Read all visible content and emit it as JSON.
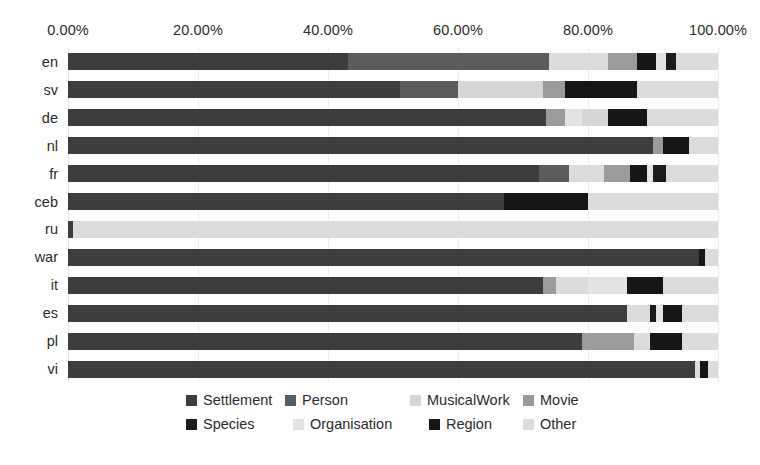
{
  "chart_data": {
    "type": "bar",
    "orientation": "horizontal",
    "stacked": true,
    "normalized": true,
    "title": "",
    "subtitle": "",
    "xlabel": "",
    "ylabel": "",
    "grid": true,
    "legend_position": "bottom",
    "xlim": [
      0,
      100
    ],
    "xtick_values": [
      0,
      20,
      40,
      60,
      80,
      100
    ],
    "xtick_labels": [
      "0.00%",
      "20.00%",
      "40.00%",
      "60.00%",
      "80.00%",
      "100.00%"
    ],
    "categories": [
      "en",
      "sv",
      "de",
      "nl",
      "fr",
      "ceb",
      "ru",
      "war",
      "it",
      "es",
      "pl",
      "vi"
    ],
    "series": [
      {
        "name": "Settlement",
        "color": "#3d3d3d",
        "values": [
          43.0,
          51.0,
          73.5,
          90.0,
          72.5,
          67.0,
          0.8,
          97.0,
          73.0,
          86.0,
          79.0,
          96.5
        ]
      },
      {
        "name": "Person",
        "color": "#5c5c5c",
        "values": [
          0.0,
          9.0,
          0.0,
          0.0,
          0.0,
          0.0,
          0.0,
          0.0,
          0.0,
          0.0,
          0.0,
          0.0
        ]
      },
      {
        "name": "MusicalWork",
        "color": "#d6d6d6",
        "values": [
          0.0,
          13.0,
          0.0,
          0.0,
          0.0,
          0.0,
          0.0,
          0.0,
          0.0,
          0.0,
          0.0,
          0.0
        ]
      },
      {
        "name": "Movie",
        "color": "#9b9b9b",
        "values": [
          31.0,
          0.0,
          0.0,
          0.0,
          0.0,
          0.0,
          0.0,
          0.0,
          0.0,
          0.0,
          8.0,
          0.0
        ]
      },
      {
        "name": "Species",
        "color": "#1c1c1c",
        "values": [
          0.0,
          0.0,
          0.0,
          0.0,
          0.0,
          0.0,
          0.0,
          0.0,
          0.0,
          0.0,
          0.0,
          0.0
        ]
      },
      {
        "name": "Organisation",
        "color": "#e4e4e4",
        "values": [
          8.5,
          0.0,
          6.5,
          0.0,
          5.0,
          0.0,
          0.0,
          0.0,
          6.0,
          0.0,
          0.0,
          0.0
        ]
      },
      {
        "name": "Region",
        "color": "#161616",
        "values": [
          3.0,
          11.0,
          4.0,
          4.0,
          4.5,
          13.0,
          0.0,
          1.0,
          4.0,
          3.0,
          5.0,
          1.5
        ]
      },
      {
        "name": "Other",
        "color": "#dcdcdc",
        "values": [
          14.5,
          16.0,
          16.0,
          6.0,
          18.0,
          20.0,
          99.2,
          2.0,
          17.0,
          11.0,
          8.0,
          2.0
        ]
      }
    ],
    "stacks": [
      {
        "category": "en",
        "segments": [
          {
            "name": "Settlement",
            "color": "#3d3d3d",
            "start": 0.0,
            "value": 43.0
          },
          {
            "name": "Person",
            "color": "#5c5c5c",
            "start": 43.0,
            "value": 31.0
          },
          {
            "name": "Other",
            "color": "#dcdcdc",
            "start": 74.0,
            "value": 9.0
          },
          {
            "name": "Movie",
            "color": "#9b9b9b",
            "start": 83.0,
            "value": 4.5
          },
          {
            "name": "Region",
            "color": "#161616",
            "start": 87.5,
            "value": 3.0
          },
          {
            "name": "Organisation",
            "color": "#e4e4e4",
            "start": 90.5,
            "value": 1.5
          },
          {
            "name": "Species",
            "color": "#1c1c1c",
            "start": 92.0,
            "value": 1.5
          },
          {
            "name": "Other",
            "color": "#dcdcdc",
            "start": 93.5,
            "value": 6.5
          }
        ]
      },
      {
        "category": "sv",
        "segments": [
          {
            "name": "Settlement",
            "color": "#3d3d3d",
            "start": 0.0,
            "value": 51.0
          },
          {
            "name": "Person",
            "color": "#5c5c5c",
            "start": 51.0,
            "value": 9.0
          },
          {
            "name": "MusicalWork",
            "color": "#d6d6d6",
            "start": 60.0,
            "value": 13.0
          },
          {
            "name": "Movie",
            "color": "#9b9b9b",
            "start": 73.0,
            "value": 3.5
          },
          {
            "name": "Region",
            "color": "#161616",
            "start": 76.5,
            "value": 11.0
          },
          {
            "name": "Other",
            "color": "#dcdcdc",
            "start": 87.5,
            "value": 12.5
          }
        ]
      },
      {
        "category": "de",
        "segments": [
          {
            "name": "Settlement",
            "color": "#3d3d3d",
            "start": 0.0,
            "value": 73.5
          },
          {
            "name": "Movie",
            "color": "#9b9b9b",
            "start": 73.5,
            "value": 3.0
          },
          {
            "name": "Organisation",
            "color": "#e4e4e4",
            "start": 76.5,
            "value": 2.5
          },
          {
            "name": "MusicalWork",
            "color": "#d6d6d6",
            "start": 79.0,
            "value": 4.0
          },
          {
            "name": "Region",
            "color": "#161616",
            "start": 83.0,
            "value": 6.0
          },
          {
            "name": "Other",
            "color": "#dcdcdc",
            "start": 89.0,
            "value": 11.0
          }
        ]
      },
      {
        "category": "nl",
        "segments": [
          {
            "name": "Settlement",
            "color": "#3d3d3d",
            "start": 0.0,
            "value": 90.0
          },
          {
            "name": "Movie",
            "color": "#9b9b9b",
            "start": 90.0,
            "value": 1.5
          },
          {
            "name": "Region",
            "color": "#161616",
            "start": 91.5,
            "value": 4.0
          },
          {
            "name": "Other",
            "color": "#dcdcdc",
            "start": 95.5,
            "value": 4.5
          }
        ]
      },
      {
        "category": "fr",
        "segments": [
          {
            "name": "Settlement",
            "color": "#3d3d3d",
            "start": 0.0,
            "value": 72.5
          },
          {
            "name": "Person",
            "color": "#5c5c5c",
            "start": 72.5,
            "value": 4.5
          },
          {
            "name": "Other",
            "color": "#dcdcdc",
            "start": 77.0,
            "value": 5.5
          },
          {
            "name": "Movie",
            "color": "#9b9b9b",
            "start": 82.5,
            "value": 4.0
          },
          {
            "name": "Region",
            "color": "#161616",
            "start": 86.5,
            "value": 2.5
          },
          {
            "name": "Organisation",
            "color": "#e4e4e4",
            "start": 89.0,
            "value": 1.0
          },
          {
            "name": "Species",
            "color": "#1c1c1c",
            "start": 90.0,
            "value": 2.0
          },
          {
            "name": "Other",
            "color": "#dcdcdc",
            "start": 92.0,
            "value": 8.0
          }
        ]
      },
      {
        "category": "ceb",
        "segments": [
          {
            "name": "Settlement",
            "color": "#3d3d3d",
            "start": 0.0,
            "value": 67.0
          },
          {
            "name": "Region",
            "color": "#161616",
            "start": 67.0,
            "value": 13.0
          },
          {
            "name": "Other",
            "color": "#dcdcdc",
            "start": 80.0,
            "value": 20.0
          }
        ]
      },
      {
        "category": "ru",
        "segments": [
          {
            "name": "Settlement",
            "color": "#3d3d3d",
            "start": 0.0,
            "value": 0.8
          },
          {
            "name": "Other",
            "color": "#dcdcdc",
            "start": 0.8,
            "value": 99.2
          }
        ]
      },
      {
        "category": "war",
        "segments": [
          {
            "name": "Settlement",
            "color": "#3d3d3d",
            "start": 0.0,
            "value": 97.0
          },
          {
            "name": "Region",
            "color": "#161616",
            "start": 97.0,
            "value": 1.0
          },
          {
            "name": "Other",
            "color": "#dcdcdc",
            "start": 98.0,
            "value": 2.0
          }
        ]
      },
      {
        "category": "it",
        "segments": [
          {
            "name": "Settlement",
            "color": "#3d3d3d",
            "start": 0.0,
            "value": 73.0
          },
          {
            "name": "Movie",
            "color": "#9b9b9b",
            "start": 73.0,
            "value": 2.0
          },
          {
            "name": "Other",
            "color": "#dcdcdc",
            "start": 75.0,
            "value": 5.0
          },
          {
            "name": "Organisation",
            "color": "#e4e4e4",
            "start": 80.0,
            "value": 6.0
          },
          {
            "name": "Region",
            "color": "#161616",
            "start": 86.0,
            "value": 5.5
          },
          {
            "name": "Other",
            "color": "#dcdcdc",
            "start": 91.5,
            "value": 8.5
          }
        ]
      },
      {
        "category": "es",
        "segments": [
          {
            "name": "Settlement",
            "color": "#3d3d3d",
            "start": 0.0,
            "value": 86.0
          },
          {
            "name": "Other",
            "color": "#dcdcdc",
            "start": 86.0,
            "value": 3.5
          },
          {
            "name": "Species",
            "color": "#1c1c1c",
            "start": 89.5,
            "value": 1.0
          },
          {
            "name": "Organisation",
            "color": "#e4e4e4",
            "start": 90.5,
            "value": 1.0
          },
          {
            "name": "Region",
            "color": "#161616",
            "start": 91.5,
            "value": 3.0
          },
          {
            "name": "Other",
            "color": "#dcdcdc",
            "start": 94.5,
            "value": 5.5
          }
        ]
      },
      {
        "category": "pl",
        "segments": [
          {
            "name": "Settlement",
            "color": "#3d3d3d",
            "start": 0.0,
            "value": 79.0
          },
          {
            "name": "Movie",
            "color": "#9b9b9b",
            "start": 79.0,
            "value": 8.0
          },
          {
            "name": "Other",
            "color": "#dcdcdc",
            "start": 87.0,
            "value": 2.5
          },
          {
            "name": "Region",
            "color": "#161616",
            "start": 89.5,
            "value": 5.0
          },
          {
            "name": "Other",
            "color": "#dcdcdc",
            "start": 94.5,
            "value": 5.5
          }
        ]
      },
      {
        "category": "vi",
        "segments": [
          {
            "name": "Settlement",
            "color": "#3d3d3d",
            "start": 0.0,
            "value": 96.5
          },
          {
            "name": "Other",
            "color": "#dcdcdc",
            "start": 96.5,
            "value": 0.8
          },
          {
            "name": "Region",
            "color": "#161616",
            "start": 97.3,
            "value": 1.2
          },
          {
            "name": "Other",
            "color": "#dcdcdc",
            "start": 98.5,
            "value": 1.5
          }
        ]
      }
    ],
    "legend": [
      [
        {
          "label": "Settlement",
          "color": "#3d3d3d",
          "x": 186
        },
        {
          "label": "Person",
          "color": "#5c5c5c",
          "x": 285
        },
        {
          "label": "MusicalWork",
          "color": "#d6d6d6",
          "x": 410
        },
        {
          "label": "Movie",
          "color": "#9b9b9b",
          "x": 523
        }
      ],
      [
        {
          "label": "Species",
          "color": "#1c1c1c",
          "x": 186
        },
        {
          "label": "Organisation",
          "color": "#e4e4e4",
          "x": 293
        },
        {
          "label": "Region",
          "color": "#161616",
          "x": 429
        },
        {
          "label": "Other",
          "color": "#dcdcdc",
          "x": 523
        }
      ]
    ]
  }
}
